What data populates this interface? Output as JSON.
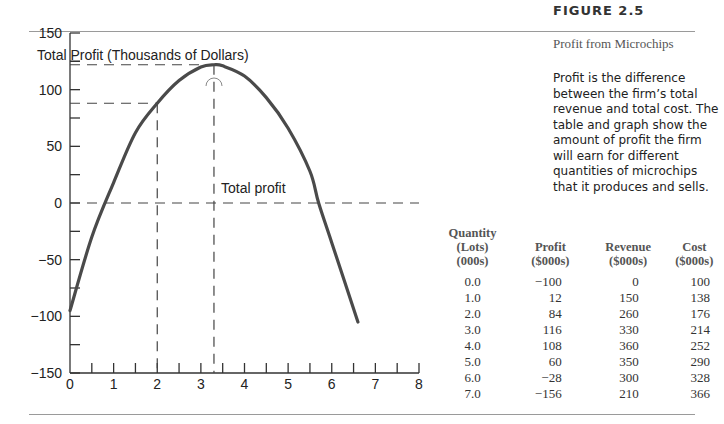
{
  "figure": {
    "label": "FIGURE 2.5",
    "title": "Profit from Microchips",
    "description": "Profit is the difference between the firm’s total revenue and total cost. The table and graph show the amount of profit the firm will earn for different quantities of microchips that it produces and sells."
  },
  "chart_data": {
    "type": "line",
    "title": "",
    "ylabel": "Total Profit (Thousands of Dollars)",
    "xlabel": "",
    "xlim": [
      0,
      8
    ],
    "ylim": [
      -150,
      150
    ],
    "x_ticks": [
      "0",
      "1",
      "2",
      "3",
      "4",
      "5",
      "6",
      "7",
      "8"
    ],
    "y_ticks": [
      "150",
      "100",
      "50",
      "0",
      "−50",
      "−100",
      "−150"
    ],
    "grid": false,
    "series": [
      {
        "name": "Total profit",
        "x": [
          0,
          0.5,
          1,
          1.5,
          2,
          2.5,
          3,
          3.3,
          3.5,
          4,
          4.5,
          5,
          5.5,
          5.7,
          6,
          6.6
        ],
        "values": [
          -95,
          -30,
          18,
          62,
          88,
          108,
          120,
          122,
          121,
          112,
          93,
          66,
          28,
          0,
          -35,
          -105
        ]
      }
    ],
    "reference_lines": {
      "horizontal": [
        122,
        88,
        0
      ],
      "vertical": [
        2,
        3.3
      ]
    },
    "annotations": [
      {
        "text": "Total profit",
        "x": 3.4,
        "y": 38
      }
    ],
    "table": {
      "columns": [
        "Quantity\n(Lots)\n(000s)",
        "Profit\n($000s)",
        "Revenue\n($000s)",
        "Cost\n($000s)"
      ],
      "rows": [
        [
          "0.0",
          "−100",
          "0",
          "100"
        ],
        [
          "1.0",
          "12",
          "150",
          "138"
        ],
        [
          "2.0",
          "84",
          "260",
          "176"
        ],
        [
          "3.0",
          "116",
          "330",
          "214"
        ],
        [
          "4.0",
          "108",
          "360",
          "252"
        ],
        [
          "5.0",
          "60",
          "350",
          "290"
        ],
        [
          "6.0",
          "−28",
          "300",
          "328"
        ],
        [
          "7.0",
          "−156",
          "210",
          "366"
        ]
      ]
    }
  }
}
